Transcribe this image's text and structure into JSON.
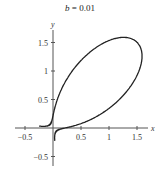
{
  "chart_data": {
    "type": "line",
    "title": "b = 0.01",
    "title_parts": {
      "var": "b",
      "rest": " = 0.01"
    },
    "equation": "x^3 + y^3 - 3xy = b",
    "xlabel": "x",
    "ylabel": "y",
    "xlim": [
      -0.55,
      1.7
    ],
    "ylim": [
      -0.6,
      1.7
    ],
    "xticks": [
      -0.5,
      0.5,
      1,
      1.5
    ],
    "xtick_labels": [
      "−0.5",
      "0.5",
      "1",
      "1.5"
    ],
    "yticks": [
      -0.5,
      0.5,
      1,
      1.5
    ],
    "ytick_labels": [
      "−0.5",
      "0.5",
      "1",
      "1.5"
    ],
    "grid": false,
    "legend": null,
    "series": [
      {
        "name": "loop branch",
        "description": "closed loop through (0.05,0.05) to (1.6,1.6) region, rightmost x≈1.6, top y≈1.6, plus left tail toward (-0.5,0.1)"
      },
      {
        "name": "lower branch",
        "description": "curve from (0.05,-0.5) up toward (0.1,-0.05) then right along x-axis toward (0.5,0.03)"
      }
    ],
    "color": "#222222"
  },
  "mapping": {
    "x0": 53,
    "y0": 128,
    "sx": 56,
    "sy": 57
  }
}
